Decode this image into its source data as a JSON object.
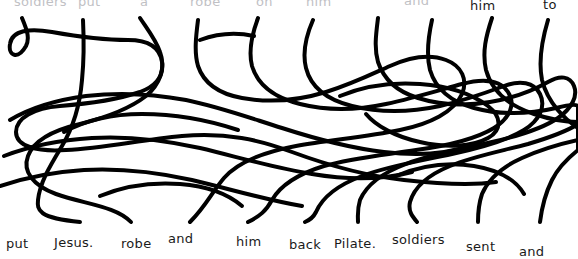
{
  "puzzle": {
    "type": "line-matching-maze",
    "line_color": "#000000",
    "text_color": "#1a1a1a",
    "background_color": "#ffffff",
    "stroke_width": 4,
    "strand_count": 10
  },
  "top_labels": [
    {
      "text": "soldiers",
      "x": 14,
      "y": -6,
      "clipped": true
    },
    {
      "text": "put",
      "x": 78,
      "y": -6,
      "clipped": true
    },
    {
      "text": "a",
      "x": 140,
      "y": -6,
      "clipped": true
    },
    {
      "text": "robe",
      "x": 190,
      "y": -6,
      "clipped": true
    },
    {
      "text": "on",
      "x": 256,
      "y": -6,
      "clipped": true
    },
    {
      "text": "him",
      "x": 306,
      "y": -6,
      "clipped": true
    },
    {
      "text": "and",
      "x": 404,
      "y": -7,
      "clipped": true
    },
    {
      "text": "him",
      "x": 470,
      "y": -2,
      "clipped": false
    },
    {
      "text": "to",
      "x": 543,
      "y": -3,
      "clipped": false
    }
  ],
  "bottom_labels": [
    {
      "text": "put",
      "x": 6,
      "y": 236
    },
    {
      "text": "Jesus.",
      "x": 54,
      "y": 235
    },
    {
      "text": "robe",
      "x": 121,
      "y": 236
    },
    {
      "text": "and",
      "x": 168,
      "y": 231
    },
    {
      "text": "him",
      "x": 236,
      "y": 234
    },
    {
      "text": "back",
      "x": 289,
      "y": 237
    },
    {
      "text": "Pilate.",
      "x": 334,
      "y": 236
    },
    {
      "text": "soldiers",
      "x": 392,
      "y": 232
    },
    {
      "text": "sent",
      "x": 466,
      "y": 239
    },
    {
      "text": "and",
      "x": 519,
      "y": 244
    }
  ],
  "strands": [
    {
      "name": "strand-1",
      "top_x": 22,
      "bottom_x": 16
    },
    {
      "name": "strand-2",
      "top_x": 83,
      "bottom_x": 80
    },
    {
      "name": "strand-3",
      "top_x": 140,
      "bottom_x": 131
    },
    {
      "name": "strand-4",
      "top_x": 198,
      "bottom_x": 190
    },
    {
      "name": "strand-5",
      "top_x": 258,
      "bottom_x": 248
    },
    {
      "name": "strand-6",
      "top_x": 313,
      "bottom_x": 305
    },
    {
      "name": "strand-7",
      "top_x": 378,
      "bottom_x": 358
    },
    {
      "name": "strand-8",
      "top_x": 432,
      "bottom_x": 417
    },
    {
      "name": "strand-9",
      "top_x": 492,
      "bottom_x": 478
    },
    {
      "name": "strand-10",
      "top_x": 548,
      "bottom_x": 540
    }
  ],
  "paths": [
    "M22,18 C27,30 30,38 26,46 C18,60 8,56 10,44 C12,30 30,28 52,32 C80,37 104,40 128,40 C150,40 160,48 162,62 C164,76 156,86 140,92 C116,100 86,104 60,106 C34,108 16,118 16,132 C16,146 36,152 66,150 C104,148 140,140 182,136 C226,132 260,140 292,152 C330,166 366,176 404,180 C440,184 470,186 496,182",
    "M83,20 C84,40 84,60 82,80 C80,104 74,126 62,146 C50,166 40,182 38,200 C37,210 38,218 80,222",
    "M140,18 C148,30 156,40 160,52 C166,68 160,84 146,96 C128,110 104,118 80,124 C54,130 34,140 28,156 C22,172 34,186 56,194 C84,204 116,206 131,222",
    "M198,20 C196,36 194,52 198,66 C204,84 220,94 242,98 C270,103 300,100 326,92 C352,84 372,74 390,66 C410,57 430,54 446,60 C462,66 468,80 462,94 C454,112 430,124 400,130 C366,137 330,140 296,146 C264,152 238,162 224,178 C212,192 206,206 190,222",
    "M258,18 C252,34 248,50 252,66 C258,86 276,98 300,104 C328,111 358,110 386,104 C414,98 440,90 462,84 C484,78 500,80 508,92 C516,104 510,118 494,128 C474,140 446,146 416,150 C384,155 352,158 324,166 C298,174 280,186 272,200 C266,211 260,216 248,222",
    "M313,20 C306,36 302,52 306,68 C311,88 328,100 352,106 C380,113 412,112 440,106 C466,100 488,92 504,86 C520,80 534,82 540,94 C546,106 540,120 524,130 C506,141 480,148 452,154 C420,161 388,166 362,176 C338,185 322,198 316,212 C313,218 310,220 305,222",
    "M378,18 C376,34 374,48 378,62 C384,80 398,92 418,98 C440,105 466,106 490,102 C514,98 534,90 548,82 C560,75 570,76 574,86 C578,96 572,108 558,118 C542,129 518,136 492,142 C462,149 432,154 406,164 C382,173 366,186 360,200 C357,210 358,216 358,222",
    "M432,20 C428,38 426,54 430,70 C436,90 452,102 474,108 C500,115 530,114 556,108 C568,105 576,104 578,106 L578,124 C566,132 548,138 528,144 C502,151 474,156 450,166 C428,175 414,188 410,202 C408,211 412,216 417,222",
    "M492,18 C486,36 482,52 486,70 C492,92 510,106 534,114 C552,120 568,122 578,122 L578,140 C560,144 540,150 522,158 C502,167 488,180 482,194 C478,206 478,214 478,222",
    "M548,20 C542,40 538,60 542,80 C548,104 566,120 578,128 L578,150 C568,158 558,168 552,180 C546,192 542,206 540,222"
  ],
  "extra_paths": [
    "M10,120 C30,108 56,100 86,96 C120,92 154,94 186,100 C220,107 250,118 282,128 C316,139 350,148 384,152 C416,156 446,154 470,146",
    "M4,156 C30,146 60,140 92,138 C128,136 164,140 200,148 C238,157 274,168 312,174 C348,180 382,180 412,172",
    "M0,186 C24,178 52,172 84,170 C120,168 156,172 192,180 C230,189 266,200 302,206",
    "M64,132 C86,120 112,114 142,114 C176,114 208,120 238,130",
    "M340,96 C364,86 392,82 420,84 C448,86 472,94 488,106 C502,117 502,130 488,138 C472,147 446,148 420,142 C396,137 376,126 366,114",
    "M396,176 C420,166 448,162 474,166 C498,170 516,180 524,194",
    "M200,40 C216,34 236,32 254,36",
    "M100,196 C124,186 152,182 180,184 C206,186 228,194 242,206"
  ]
}
